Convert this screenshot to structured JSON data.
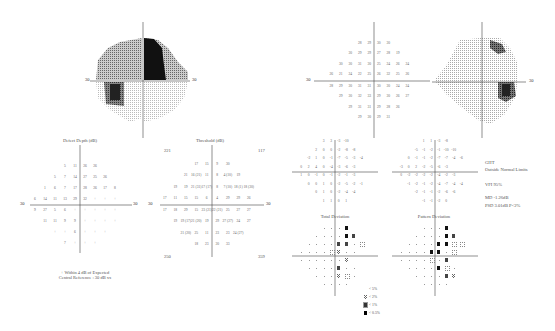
{
  "report": "Visual field perimetry printout",
  "greyscale_left": {
    "axis_label_left": "30",
    "axis_label_right": "30"
  },
  "greyscale_right": {
    "axis_label_right": "30"
  },
  "defect_depth": {
    "title": "Defect Depth (dB)",
    "axis_left": "30",
    "axis_right": "30",
    "footnote_line1": "+ Within 4 dB of Expected",
    "footnote_line2": "Central Reference : 30 dB xx"
  },
  "threshold": {
    "title": "Threshold (dB)",
    "axis_left": "30",
    "axis_right": "30",
    "corner_tl": "221",
    "corner_tr": "117",
    "corner_bl": "250",
    "corner_br": "359"
  },
  "values_plot": {
    "axis_left": "30"
  },
  "total_deviation": {
    "title": "Total Deviation"
  },
  "pattern_deviation": {
    "title": "Pattern Deviation"
  },
  "indices": {
    "ght_label": "GHT",
    "ght_value": "Outside Normal Limits",
    "vfi": "VFI   95%",
    "md": "MD    -1.26dB",
    "psd": "PSD   3.01dB P<2%"
  },
  "legend": [
    {
      "symbol": "p5",
      "label": "< 5%"
    },
    {
      "symbol": "p2",
      "label": "< 2%"
    },
    {
      "symbol": "p1",
      "label": "< 1%"
    },
    {
      "symbol": "p05",
      "label": "< 0.5%"
    }
  ],
  "chart_data": [
    {
      "type": "table",
      "title": "Defect Depth (dB)",
      "rows": [
        [
          "5",
          "11",
          "26",
          "26"
        ],
        [
          "5",
          "7",
          "14",
          "27",
          "25",
          "26"
        ],
        [
          "1",
          "6",
          "7",
          "17",
          "28",
          "26",
          "17",
          "8"
        ],
        [
          "6",
          "14",
          "11",
          "13",
          "29",
          "32",
          "+",
          "+",
          "+"
        ],
        [
          "9",
          "27",
          "5",
          "6",
          "+",
          "+",
          "+",
          "+",
          "+"
        ],
        [
          "11",
          "11",
          "9",
          "9",
          "+",
          "+",
          "+",
          "+"
        ],
        [
          "+",
          "+",
          "6",
          "+",
          "+",
          "+"
        ],
        [
          "7",
          "+",
          "+",
          "+"
        ]
      ]
    },
    {
      "type": "table",
      "title": "Threshold (dB)",
      "rows": [
        [
          "17",
          "15",
          "9",
          "30"
        ],
        [
          "21",
          "16 (21)",
          "11",
          "8",
          "4 (10)",
          "19"
        ],
        [
          "19",
          "19",
          "21 (31)",
          "17 (17)",
          "8",
          "7 (10)",
          "18 (1)",
          "18 (30)"
        ],
        [
          "17",
          "11",
          "15",
          "15",
          "6",
          "4",
          "29",
          "29",
          "26"
        ],
        [
          "17",
          "18",
          "29",
          "15",
          "23 (21)",
          "22 (21)",
          "25",
          "27",
          "27"
        ],
        [
          "19",
          "19 (17)",
          "21 (20)",
          "19",
          "29",
          "27 (27)",
          "24",
          "27"
        ],
        [
          "21 (20)",
          "25",
          "11",
          "23",
          "23",
          "24 (27)"
        ],
        [
          "18",
          "23",
          "30",
          "33"
        ]
      ]
    },
    {
      "type": "table",
      "title": "Threshold values (dB)",
      "rows": [
        [
          "28",
          "29",
          "30",
          "30"
        ],
        [
          "30",
          "29",
          "29",
          "27",
          "28",
          "19"
        ],
        [
          "30",
          "30",
          "31",
          "30",
          "25",
          "24",
          "26",
          "24"
        ],
        [
          "26",
          "21",
          "24",
          "22",
          "25",
          "26",
          "32",
          "25",
          "26"
        ],
        [
          "28",
          "29",
          "30",
          "31",
          "31",
          "30",
          "30",
          "24",
          "24"
        ],
        [
          "29",
          "30",
          "32",
          "33",
          "29",
          "30",
          "26",
          "27"
        ],
        [
          "29",
          "31",
          "31",
          "29",
          "28",
          "26"
        ],
        [
          "29",
          "30",
          "29",
          "31"
        ]
      ]
    },
    {
      "type": "table",
      "title": "Total Deviation (numeric)",
      "rows": [
        [
          "3",
          "3",
          "-3",
          "-10"
        ],
        [
          "2",
          "0",
          "0",
          "-2",
          "-8",
          "-8"
        ],
        [
          "-2",
          "1",
          "0",
          "-1",
          "-7",
          "-5",
          "-3",
          "-4"
        ],
        [
          "0",
          "2",
          "4",
          "0",
          "-4",
          "-3",
          "-6",
          "-3"
        ],
        [
          "1",
          "0",
          "-1",
          "0",
          "-1",
          "-2",
          "-1",
          "-3"
        ],
        [
          "0",
          "0",
          "1",
          "0",
          "-2",
          "-5",
          "-2",
          "-1"
        ],
        [
          "0",
          "1",
          "0",
          "-2",
          "-4",
          "-4"
        ],
        [
          "1",
          "1",
          "0",
          "1"
        ]
      ]
    },
    {
      "type": "table",
      "title": "Pattern Deviation (numeric)",
      "rows": [
        [
          "1",
          "1",
          "-3",
          "-8"
        ],
        [
          "-5",
          "-1",
          "-2",
          "-1",
          "-10",
          "-10"
        ],
        [
          "0",
          "-1",
          "-1",
          "-2",
          "-7",
          "-7",
          "-4",
          "-6"
        ],
        [
          "-3",
          "0",
          "2",
          "-2",
          "-5",
          "-6",
          "-3"
        ],
        [
          "0",
          "-2",
          "-2",
          "-2",
          "-2",
          "-4",
          "-2",
          "-3"
        ],
        [
          "-1",
          "-2",
          "-1",
          "-2",
          "-4",
          "-7",
          "-4",
          "-4"
        ],
        [
          "-2",
          "-1",
          "-1",
          "-2",
          "-6",
          "-6"
        ],
        [
          "-1",
          "-1",
          "-2",
          "0"
        ]
      ]
    }
  ]
}
